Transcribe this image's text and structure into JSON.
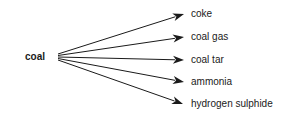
{
  "diagram": {
    "type": "flow",
    "source": "coal",
    "products": [
      "coke",
      "coal gas",
      "coal tar",
      "ammonia",
      "hydrogen sulphide"
    ],
    "edges": [
      {
        "from": "coal",
        "to": "coke"
      },
      {
        "from": "coal",
        "to": "coal gas"
      },
      {
        "from": "coal",
        "to": "coal tar"
      },
      {
        "from": "coal",
        "to": "ammonia"
      },
      {
        "from": "coal",
        "to": "hydrogen sulphide"
      }
    ],
    "colors": {
      "line": "#1a1a1a",
      "text": "#1a1a1a",
      "background": "#ffffff"
    }
  }
}
